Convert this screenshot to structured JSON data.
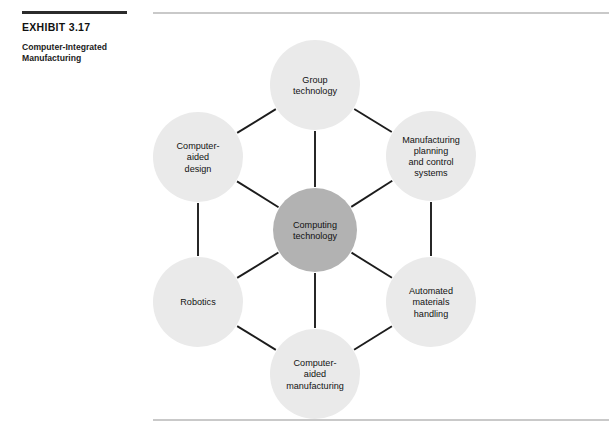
{
  "exhibit": {
    "label": "EXHIBIT 3.17",
    "caption": "Computer-Integrated Manufacturing"
  },
  "colors": {
    "outer_node_fill": "#eaeaea",
    "center_node_fill": "#b2b2b2",
    "connector": "#1c1c1c",
    "rule_dark": "#2b2b2b",
    "rule_light": "#c9c9c9",
    "text": "#121212",
    "page_background": "#ffffff"
  },
  "diagram": {
    "type": "hub-and-spoke hexagon",
    "center": {
      "id": "computing-technology",
      "lines": [
        "Computing",
        "technology"
      ],
      "cx": 165,
      "cy": 230,
      "r": 42,
      "fill": "#b2b2b2"
    },
    "nodes": [
      {
        "id": "group-technology",
        "lines": [
          "Group",
          "technology"
        ],
        "cx": 165,
        "cy": 85,
        "r": 45,
        "position": "top"
      },
      {
        "id": "manufacturing-planning-and-control-systems",
        "lines": [
          "Manufacturing",
          "planning",
          "and control",
          "systems"
        ],
        "cx": 281,
        "cy": 156,
        "r": 45,
        "position": "upper-right"
      },
      {
        "id": "automated-materials-handling",
        "lines": [
          "Automated",
          "materials",
          "handling"
        ],
        "cx": 281,
        "cy": 302,
        "r": 45,
        "position": "lower-right"
      },
      {
        "id": "computer-aided-manufacturing",
        "lines": [
          "Computer-",
          "aided",
          "manufacturing"
        ],
        "cx": 165,
        "cy": 374,
        "r": 45,
        "position": "bottom"
      },
      {
        "id": "robotics",
        "lines": [
          "Robotics"
        ],
        "cx": 48,
        "cy": 302,
        "r": 45,
        "position": "lower-left"
      },
      {
        "id": "computer-aided-design",
        "lines": [
          "Computer-",
          "aided",
          "design"
        ],
        "cx": 48,
        "cy": 157,
        "r": 45,
        "position": "upper-left"
      }
    ],
    "spokes": [
      {
        "from": "computing-technology",
        "to": "group-technology"
      },
      {
        "from": "computing-technology",
        "to": "manufacturing-planning-and-control-systems"
      },
      {
        "from": "computing-technology",
        "to": "automated-materials-handling"
      },
      {
        "from": "computing-technology",
        "to": "computer-aided-manufacturing"
      },
      {
        "from": "computing-technology",
        "to": "robotics"
      },
      {
        "from": "computing-technology",
        "to": "computer-aided-design"
      }
    ],
    "ring_edges": [
      {
        "from": "computer-aided-design",
        "to": "group-technology"
      },
      {
        "from": "group-technology",
        "to": "manufacturing-planning-and-control-systems"
      },
      {
        "from": "manufacturing-planning-and-control-systems",
        "to": "automated-materials-handling"
      },
      {
        "from": "automated-materials-handling",
        "to": "computer-aided-manufacturing"
      },
      {
        "from": "computer-aided-manufacturing",
        "to": "robotics"
      },
      {
        "from": "robotics",
        "to": "computer-aided-design"
      }
    ]
  }
}
